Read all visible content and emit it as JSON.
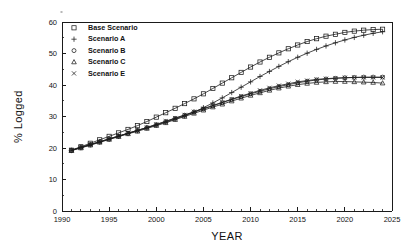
{
  "figure": {
    "background": "#ffffff",
    "ink_color": "#1c1c1c"
  },
  "axes": {
    "x_title": "YEAR",
    "y_title": "% Logged",
    "x_ticks": [
      "1990",
      "1995",
      "2000",
      "2005",
      "2010",
      "2015",
      "2020",
      "2025"
    ],
    "y_ticks": [
      "0",
      "10",
      "20",
      "30",
      "40",
      "50",
      "60"
    ]
  },
  "legend": {
    "entries": [
      {
        "label": "Base Scenario",
        "marker": "square"
      },
      {
        "label": "Scenario A",
        "marker": "plus"
      },
      {
        "label": "Scenario B",
        "marker": "circle"
      },
      {
        "label": "Scenario C",
        "marker": "triangle"
      },
      {
        "label": "Scenario E",
        "marker": "cross"
      }
    ]
  },
  "chart_data": {
    "type": "line",
    "title": "",
    "xlabel": "YEAR",
    "ylabel": "% Logged",
    "xlim": [
      1990,
      2025
    ],
    "ylim": [
      0,
      60
    ],
    "xticks": [
      1990,
      1995,
      2000,
      2005,
      2010,
      2015,
      2020,
      2025
    ],
    "yticks": [
      0,
      10,
      20,
      30,
      40,
      50,
      60
    ],
    "grid": false,
    "legend_position": "upper-left-inside",
    "x": [
      1991,
      1992,
      1993,
      1994,
      1995,
      1996,
      1997,
      1998,
      1999,
      2000,
      2001,
      2002,
      2003,
      2004,
      2005,
      2006,
      2007,
      2008,
      2009,
      2010,
      2011,
      2012,
      2013,
      2014,
      2015,
      2016,
      2017,
      2018,
      2019,
      2020,
      2021,
      2022,
      2023,
      2024
    ],
    "series": [
      {
        "name": "Base Scenario",
        "marker": "square",
        "values": [
          19.3,
          20.4,
          21.5,
          22.6,
          23.7,
          24.8,
          25.9,
          27.1,
          28.4,
          29.8,
          31.2,
          32.6,
          34.1,
          35.6,
          37.2,
          38.9,
          40.6,
          42.3,
          44.0,
          45.7,
          47.3,
          48.8,
          50.2,
          51.5,
          52.7,
          53.8,
          54.7,
          55.5,
          56.1,
          56.7,
          57.1,
          57.4,
          57.6,
          57.7
        ]
      },
      {
        "name": "Scenario A",
        "marker": "plus",
        "values": [
          19.2,
          20.1,
          21.0,
          21.9,
          22.8,
          23.7,
          24.6,
          25.5,
          26.4,
          27.3,
          28.2,
          29.2,
          30.2,
          31.4,
          32.8,
          34.3,
          35.9,
          37.6,
          39.3,
          41.0,
          42.7,
          44.3,
          45.9,
          47.4,
          48.8,
          50.1,
          51.3,
          52.4,
          53.4,
          54.3,
          55.1,
          55.8,
          56.4,
          56.9
        ]
      },
      {
        "name": "Scenario B",
        "marker": "circle",
        "values": [
          19.3,
          20.2,
          21.1,
          22.0,
          22.9,
          23.8,
          24.7,
          25.6,
          26.5,
          27.4,
          28.4,
          29.4,
          30.4,
          31.4,
          32.4,
          33.4,
          34.4,
          35.4,
          36.3,
          37.2,
          38.0,
          38.8,
          39.5,
          40.1,
          40.7,
          41.2,
          41.6,
          41.9,
          42.1,
          42.3,
          42.4,
          42.5,
          42.5,
          42.5
        ]
      },
      {
        "name": "Scenario C",
        "marker": "triangle",
        "values": [
          19.2,
          20.0,
          20.9,
          21.8,
          22.7,
          23.6,
          24.5,
          25.3,
          26.2,
          27.1,
          28.0,
          29.0,
          30.0,
          31.0,
          32.0,
          33.0,
          33.9,
          34.9,
          35.8,
          36.7,
          37.5,
          38.3,
          39.0,
          39.6,
          40.1,
          40.5,
          40.8,
          41.0,
          41.1,
          41.1,
          41.0,
          40.9,
          40.8,
          40.6
        ]
      },
      {
        "name": "Scenario E",
        "marker": "cross",
        "values": [
          19.3,
          20.2,
          21.1,
          22.0,
          22.9,
          23.8,
          24.7,
          25.6,
          26.5,
          27.5,
          28.5,
          29.5,
          30.5,
          31.5,
          32.5,
          33.5,
          34.5,
          35.5,
          36.5,
          37.4,
          38.3,
          39.1,
          39.8,
          40.4,
          41.0,
          41.4,
          41.8,
          42.0,
          42.2,
          42.3,
          42.4,
          42.4,
          42.4,
          42.4
        ]
      }
    ]
  }
}
